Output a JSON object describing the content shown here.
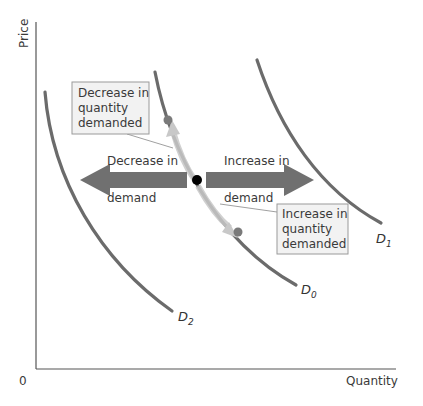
{
  "diagram": {
    "axes": {
      "y_label": "Price",
      "x_label": "Quantity",
      "origin_label": "0"
    },
    "curves": [
      {
        "id": "D0",
        "label": "D",
        "subscript": "0"
      },
      {
        "id": "D1",
        "label": "D",
        "subscript": "1"
      },
      {
        "id": "D2",
        "label": "D",
        "subscript": "2"
      }
    ],
    "arrows": {
      "left": {
        "line1": "Decrease in",
        "line2": "demand"
      },
      "right": {
        "line1": "Increase in",
        "line2": "demand"
      }
    },
    "callouts": {
      "top": {
        "line1": "Decrease in",
        "line2": "quantity",
        "line3": "demanded"
      },
      "bottom": {
        "line1": "Increase in",
        "line2": "quantity",
        "line3": "demanded"
      }
    },
    "colors": {
      "curve": "#6b6b6b",
      "arrow": "#707070",
      "callout_bg": "#f2f2f2",
      "callout_border": "#9a9a9a",
      "point": "#000000",
      "point_grey": "#7a7a7a"
    }
  }
}
